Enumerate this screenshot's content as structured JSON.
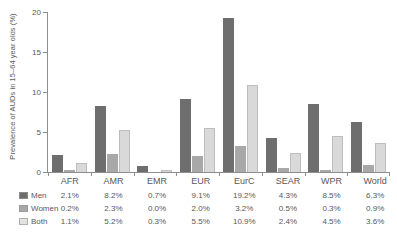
{
  "chart_data": {
    "type": "bar",
    "title": "",
    "subtitle": "",
    "xlabel": "",
    "ylabel": "Prevalence of AUDs in 15–64 year olds (%)",
    "ylim": [
      0,
      20
    ],
    "yticks": [
      0,
      5,
      10,
      15,
      20
    ],
    "ytick_labels": [
      "0",
      "5",
      "10",
      "15",
      "20"
    ],
    "grid": false,
    "legend_position": "below-table-rows",
    "categories": [
      "AFR",
      "AMR",
      "EMR",
      "EUR",
      "EurC",
      "SEAR",
      "WPR",
      "World"
    ],
    "series": [
      {
        "name": "Men",
        "color": "#6e6e6e",
        "values": [
          2.1,
          8.2,
          0.7,
          9.1,
          19.2,
          4.3,
          8.5,
          6.3
        ],
        "labels": [
          "2.1%",
          "8.2%",
          "0.7%",
          "9.1%",
          "19.2%",
          "4.3%",
          "8.5%",
          "6.3%"
        ]
      },
      {
        "name": "Women",
        "color": "#a8a8a8",
        "values": [
          0.2,
          2.3,
          0.0,
          2.0,
          3.2,
          0.5,
          0.3,
          0.9
        ],
        "labels": [
          "0.2%",
          "2.3%",
          "0.0%",
          "2.0%",
          "3.2%",
          "0.5%",
          "0.3%",
          "0.9%"
        ]
      },
      {
        "name": "Both",
        "color": "#d9d9d9",
        "values": [
          1.1,
          5.2,
          0.3,
          5.5,
          10.9,
          2.4,
          4.5,
          3.6
        ],
        "labels": [
          "1.1%",
          "5.2%",
          "0.3%",
          "5.5%",
          "10.9%",
          "2.4%",
          "4.5%",
          "3.6%"
        ]
      }
    ]
  }
}
